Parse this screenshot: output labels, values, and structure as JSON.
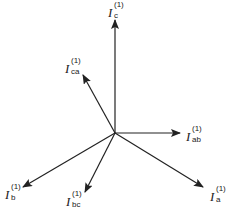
{
  "diagram": {
    "type": "phasor-diagram",
    "line_color": "#222222",
    "background": "#ffffff",
    "origin": {
      "x": 115,
      "y": 133
    },
    "phasors": [
      {
        "id": "c",
        "symbol": "I",
        "superscript": "(1)",
        "subscript": "c",
        "tip": {
          "x": 115,
          "y": 20
        }
      },
      {
        "id": "ca",
        "symbol": "I",
        "superscript": "(1)",
        "subscript": "ca",
        "tip": {
          "x": 83,
          "y": 75
        }
      },
      {
        "id": "ab",
        "symbol": "I",
        "superscript": "(1)",
        "subscript": "ab",
        "tip": {
          "x": 180,
          "y": 133
        }
      },
      {
        "id": "b",
        "symbol": "I",
        "superscript": "(1)",
        "subscript": "b",
        "tip": {
          "x": 23,
          "y": 187
        }
      },
      {
        "id": "bc",
        "symbol": "I",
        "superscript": "(1)",
        "subscript": "bc",
        "tip": {
          "x": 85,
          "y": 192
        }
      },
      {
        "id": "a",
        "symbol": "I",
        "superscript": "(1)",
        "subscript": "a",
        "tip": {
          "x": 203,
          "y": 187
        }
      }
    ]
  }
}
